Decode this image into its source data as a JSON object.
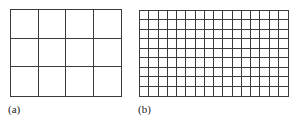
{
  "panels": [
    {
      "label": "(a)",
      "cols": 4,
      "rows": 3,
      "x": 10,
      "y": 9,
      "width": 112,
      "height": 88,
      "label_x": 8,
      "label_y": 103
    },
    {
      "label": "(b)",
      "cols": 16,
      "rows": 9,
      "x": 139,
      "y": 10,
      "width": 150,
      "height": 87,
      "label_x": 138,
      "label_y": 103
    }
  ],
  "line_color": "#3a3a3a"
}
